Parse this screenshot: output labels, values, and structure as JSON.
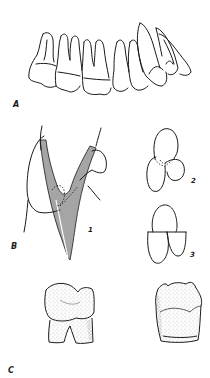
{
  "figure": {
    "panels": [
      {
        "id": "A",
        "label": "A",
        "description": "lateral view of upper dental arch (molars, premolars, canine, incisors)"
      },
      {
        "id": "B",
        "label": "B",
        "description": "sectional views",
        "sub_figures": [
          {
            "id": "1",
            "label": "1",
            "description": "hatched cross-section of tooth root with adjacent outline"
          },
          {
            "id": "2",
            "label": "2",
            "description": "three-cusp outline with dashed internal lines"
          },
          {
            "id": "3",
            "label": "3",
            "description": "three-lobe outline with straight division"
          }
        ]
      },
      {
        "id": "C",
        "label": "C",
        "description": "two stippled molar drawings",
        "items": [
          {
            "id": "C-left",
            "description": "molar with two roots"
          },
          {
            "id": "C-right",
            "description": "worn molar crown"
          }
        ]
      }
    ],
    "colors": {
      "ink": "#1a1a1a",
      "background": "#ffffff",
      "stipple": "#9a9a9a"
    }
  }
}
